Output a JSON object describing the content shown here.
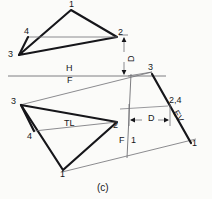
{
  "figure": {
    "caption": "(c)",
    "type": "descriptive-geometry-orthographic-projection"
  },
  "fold_lines": {
    "hf": {
      "upper_label": "H",
      "lower_label": "F"
    },
    "f1": {
      "upper_label": "F",
      "lower_label": "1"
    }
  },
  "top_view": {
    "name": "horizontal-view-triangle",
    "vertices": [
      {
        "id": "1",
        "label": "1",
        "x": 71,
        "y": 7
      },
      {
        "id": "2",
        "label": "2",
        "x": 118,
        "y": 34
      },
      {
        "id": "3",
        "label": "3",
        "x": 15,
        "y": 53
      },
      {
        "id": "4",
        "label": "4",
        "x": 31,
        "y": 34
      }
    ]
  },
  "auxiliary_view": {
    "name": "auxiliary-view-triangle",
    "vertices": [
      {
        "id": "3",
        "label": "3",
        "x": 20,
        "y": 103
      },
      {
        "id": "2",
        "label": "2",
        "x": 117,
        "y": 119
      },
      {
        "id": "4",
        "label": "4",
        "x": 30,
        "y": 131
      },
      {
        "id": "1",
        "label": "1",
        "x": 62,
        "y": 170
      }
    ],
    "annotations": {
      "true_length": "TL",
      "edge_view": "EV"
    }
  },
  "edge_view_line": {
    "name": "edge-view-line",
    "start_label": "3",
    "end_label": "1",
    "mid_label": "2,4"
  },
  "dimension": {
    "name": "depth-dimension",
    "label": "D",
    "vertical_label": "D"
  },
  "colors": {
    "ink": "#16161a",
    "thin_line": "#6f6f74",
    "paper": "#fbfbf9"
  }
}
